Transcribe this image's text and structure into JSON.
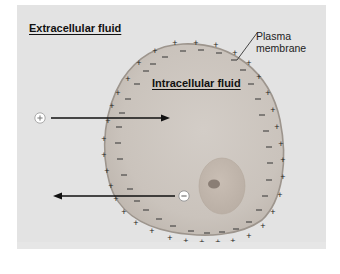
{
  "diagram": {
    "labels": {
      "extracellular": "Extracellular fluid",
      "intracellular": "Intracellular fluid",
      "membrane_line1": "Plasma",
      "membrane_line2": "membrane"
    },
    "ions": {
      "positive": {
        "symbol": "+",
        "direction": "into cell"
      },
      "negative": {
        "symbol": "−",
        "direction": "out of cell"
      }
    },
    "charges": {
      "outside": "+",
      "inside": "−"
    },
    "colors": {
      "background": "#e3e3e3",
      "cytoplasm": "#c9c2bb",
      "membrane": "#a09890",
      "nucleus": "#c2b7ad",
      "nucleolus": "#8d8178",
      "arrow": "#111111"
    }
  }
}
